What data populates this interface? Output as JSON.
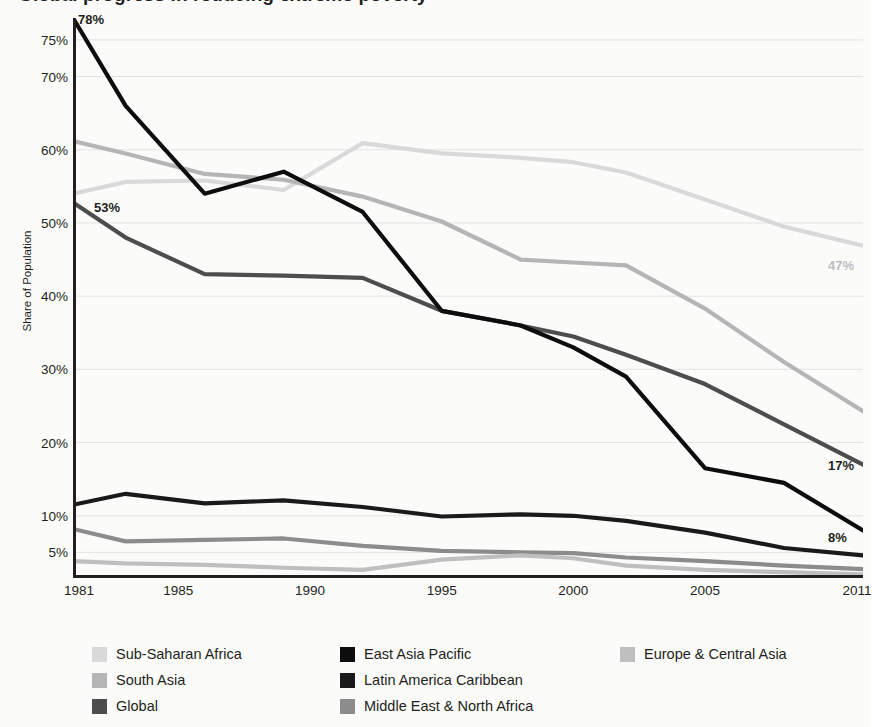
{
  "title": "Global progress in reducing extreme poverty",
  "y_axis_title": "Share of Population",
  "colors": {
    "sub_saharan_africa": "#d9d9d9",
    "south_asia": "#b5b5b5",
    "global": "#4d4d4d",
    "east_asia_pacific": "#0d0d0d",
    "latin_america_caribbean": "#1a1a1a",
    "middle_east_north_africa": "#8c8c8c",
    "europe_central_asia": "#bfbfbf",
    "grid": "#e3e3e1",
    "axis": "#231f20",
    "background": "#fbfbfa"
  },
  "legend": {
    "columns": [
      {
        "items": [
          {
            "label": "Sub-Saharan Africa",
            "color": "#d9d9d9",
            "key": "sub-saharan-africa"
          },
          {
            "label": "South Asia",
            "color": "#b5b5b5",
            "key": "south-asia"
          },
          {
            "label": "Global",
            "color": "#4d4d4d",
            "key": "global"
          }
        ]
      },
      {
        "items": [
          {
            "label": "East Asia Pacific",
            "color": "#0d0d0d",
            "key": "east-asia-pacific"
          },
          {
            "label": "Latin America Caribbean",
            "color": "#1a1a1a",
            "key": "latin-america-caribbean"
          },
          {
            "label": "Middle East & North Africa",
            "color": "#8c8c8c",
            "key": "middle-east-north-africa"
          }
        ]
      },
      {
        "items": [
          {
            "label": "Europe & Central Asia",
            "color": "#bfbfbf",
            "key": "europe-central-asia"
          }
        ]
      }
    ]
  },
  "annotations": [
    {
      "text": "78%",
      "series": "East Asia Pacific",
      "year": 1981,
      "value": 78,
      "color": "#231f20",
      "x": 78,
      "y": 12,
      "anchor": "left"
    },
    {
      "text": "53%",
      "series": "Global",
      "year": 1981,
      "value": 53,
      "color": "#231f20",
      "x": 94,
      "y": 200,
      "anchor": "left"
    },
    {
      "text": "47%",
      "series": "Sub-Saharan Africa",
      "year": 2011,
      "value": 47,
      "color": "#bdbdbd",
      "x": 828,
      "y": 258,
      "anchor": "left"
    },
    {
      "text": "17%",
      "series": "Global",
      "year": 2011,
      "value": 17,
      "color": "#231f20",
      "x": 828,
      "y": 458,
      "anchor": "left"
    },
    {
      "text": "8%",
      "series": "East Asia Pacific",
      "year": 2011,
      "value": 8,
      "color": "#231f20",
      "x": 828,
      "y": 530,
      "anchor": "left"
    }
  ],
  "chart_data": {
    "type": "line",
    "title": "Global progress in reducing extreme poverty",
    "xlabel": "",
    "ylabel": "Share of Population",
    "grid": true,
    "legend_position": "bottom",
    "xlim": [
      1981,
      2011
    ],
    "ylim": [
      1.5,
      78
    ],
    "x_ticks": [
      1981,
      1985,
      1990,
      1995,
      2000,
      2005,
      2011
    ],
    "y_ticks": [
      5,
      10,
      20,
      30,
      40,
      50,
      60,
      70,
      75
    ],
    "y_tick_labels": [
      "5%",
      "10%",
      "20%",
      "30%",
      "40%",
      "50%",
      "60%",
      "70%",
      "75%"
    ],
    "x": [
      1981,
      1983,
      1986,
      1989,
      1992,
      1995,
      1998,
      2000,
      2002,
      2005,
      2008,
      2011
    ],
    "series": [
      {
        "name": "Sub-Saharan Africa",
        "color": "#d9d9d9",
        "values": [
          54.0,
          55.6,
          55.8,
          54.5,
          60.9,
          59.5,
          58.9,
          58.3,
          56.9,
          53.2,
          49.5,
          46.9
        ],
        "end_label": "47%"
      },
      {
        "name": "South Asia",
        "color": "#b5b5b5",
        "values": [
          61.2,
          59.5,
          56.7,
          55.9,
          53.6,
          50.2,
          45.0,
          44.6,
          44.2,
          38.3,
          31.0,
          24.3
        ],
        "end_label": ""
      },
      {
        "name": "Global",
        "color": "#4d4d4d",
        "values": [
          52.8,
          48.0,
          43.0,
          42.8,
          42.5,
          38.0,
          36.0,
          34.5,
          32.0,
          28.0,
          22.5,
          17.0
        ],
        "start_label": "53%",
        "end_label": "17%"
      },
      {
        "name": "East Asia Pacific",
        "color": "#0d0d0d",
        "values": [
          78.0,
          66.0,
          54.0,
          57.0,
          51.5,
          38.0,
          36.0,
          33.0,
          29.0,
          16.5,
          14.5,
          8.0
        ],
        "start_label": "78%",
        "end_label": "8%"
      },
      {
        "name": "Latin America Caribbean",
        "color": "#1a1a1a",
        "values": [
          11.5,
          13.0,
          11.7,
          12.1,
          11.2,
          9.9,
          10.2,
          10.0,
          9.3,
          7.7,
          5.6,
          4.6
        ],
        "end_label": ""
      },
      {
        "name": "Middle East & North Africa",
        "color": "#8c8c8c",
        "values": [
          8.2,
          6.5,
          6.7,
          6.9,
          5.9,
          5.2,
          5.0,
          4.9,
          4.3,
          3.8,
          3.2,
          2.7
        ],
        "end_label": ""
      },
      {
        "name": "Europe & Central Asia",
        "color": "#bfbfbf",
        "values": [
          3.8,
          3.5,
          3.3,
          2.9,
          2.6,
          4.0,
          4.6,
          4.2,
          3.2,
          2.6,
          2.3,
          2.0
        ],
        "end_label": ""
      }
    ]
  }
}
